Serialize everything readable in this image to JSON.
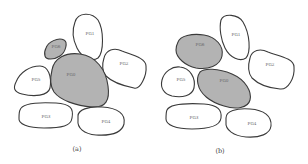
{
  "figure": {
    "panels": [
      {
        "caption": "(a)",
        "regions": [
          {
            "id": "top",
            "label": "PG1",
            "shaded": false
          },
          {
            "id": "right",
            "label": "PG2",
            "shaded": false
          },
          {
            "id": "small",
            "label": "PG6",
            "shaded": true
          },
          {
            "id": "center",
            "label": "PG0",
            "shaded": true
          },
          {
            "id": "left",
            "label": "PG5",
            "shaded": false
          },
          {
            "id": "bottom-left",
            "label": "PG3",
            "shaded": false
          },
          {
            "id": "bottom-right",
            "label": "PG4",
            "shaded": false
          }
        ]
      },
      {
        "caption": "(b)",
        "regions": [
          {
            "id": "top",
            "label": "PG1",
            "shaded": false
          },
          {
            "id": "right",
            "label": "PG2",
            "shaded": false
          },
          {
            "id": "upper-left",
            "label": "PG6",
            "shaded": true
          },
          {
            "id": "center",
            "label": "PG0",
            "shaded": true
          },
          {
            "id": "left",
            "label": "PG5",
            "shaded": false
          },
          {
            "id": "bottom-left",
            "label": "PG3",
            "shaded": false
          },
          {
            "id": "bottom-right",
            "label": "PG4",
            "shaded": false
          }
        ]
      }
    ],
    "colors": {
      "shaded": "#b3b3b3",
      "outline": "#3a3a3a"
    }
  }
}
